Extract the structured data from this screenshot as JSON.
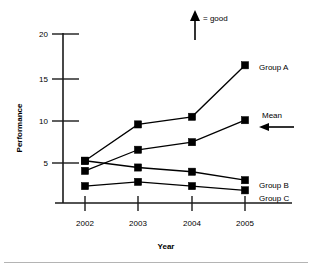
{
  "chart_data": {
    "type": "line",
    "title": "",
    "xlabel": "Year",
    "ylabel": "Performance",
    "categories": [
      "2002",
      "2003",
      "2004",
      "2005"
    ],
    "x": [
      2002,
      2003,
      2004,
      2005
    ],
    "xlim": [
      2001.4,
      2005.6
    ],
    "ylim": [
      0,
      20
    ],
    "yticks": [
      5,
      10,
      15,
      20
    ],
    "ytick_labels": [
      "5",
      "10",
      "15",
      "20"
    ],
    "grid": false,
    "legend_position": "right-inline-end-of-line",
    "marker": "filled-square",
    "series": [
      {
        "name": "Group A",
        "values": [
          5.0,
          9.3,
          10.2,
          16.3
        ]
      },
      {
        "name": "Mean",
        "values": [
          3.8,
          6.3,
          7.2,
          9.8
        ]
      },
      {
        "name": "Group B",
        "values": [
          5.0,
          4.2,
          3.7,
          2.7
        ]
      },
      {
        "name": "Group C",
        "values": [
          2.0,
          2.5,
          2.0,
          1.5
        ]
      }
    ],
    "annotations": [
      {
        "name": "good-direction",
        "text": "= good",
        "arrow": "up"
      },
      {
        "name": "mean-callout",
        "text": "Mean",
        "arrow": "left"
      }
    ]
  },
  "axes": {
    "y_title": "Performance",
    "x_title": "Year",
    "y_ticks": [
      "20",
      "15",
      "10",
      "5"
    ],
    "x_ticks": [
      "2002",
      "2003",
      "2004",
      "2005"
    ]
  },
  "series_labels": {
    "group_a": "Group A",
    "mean": "Mean",
    "group_b": "Group B",
    "group_c": "Group C"
  },
  "annotations": {
    "good": "= good",
    "mean": "Mean"
  },
  "colors": {
    "ink": "#000000",
    "axis": "#1a1a1a",
    "background": "#ffffff",
    "rule": "#b4b4b4"
  }
}
